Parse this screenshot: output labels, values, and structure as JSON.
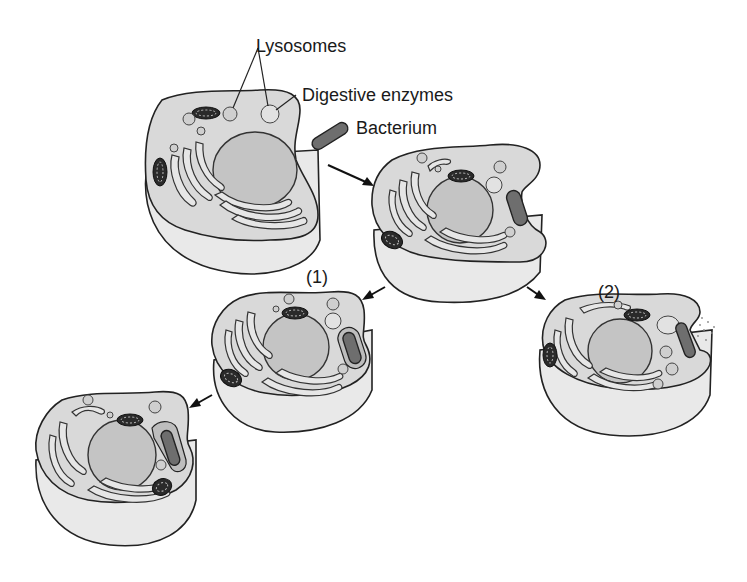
{
  "diagram": {
    "labels": {
      "lysosomes": "Lysosomes",
      "digestive_enzymes": "Digestive enzymes",
      "bacterium": "Bacterium",
      "pathway_1": "(1)",
      "pathway_2": "(2)"
    },
    "stages": [
      {
        "id": "cell-1",
        "description": "Cell with lysosomes; bacterium approaching"
      },
      {
        "id": "cell-2",
        "description": "Bacterium engulfed into vacuole"
      },
      {
        "id": "cell-3",
        "description": "Pathway (1): lysosomes approach vacuole"
      },
      {
        "id": "cell-4",
        "description": "Lysosome fuses with vacuole, enzymes digest bacterium"
      },
      {
        "id": "cell-5",
        "description": "Pathway (2): enzymes released outside cell"
      }
    ],
    "colors": {
      "cytoplasm": "#d9d9d9",
      "nucleus": "#c4c4c4",
      "mitochondria": "#2a2a2a",
      "bacterium": "#6e6e6e",
      "outline": "#222222"
    }
  }
}
